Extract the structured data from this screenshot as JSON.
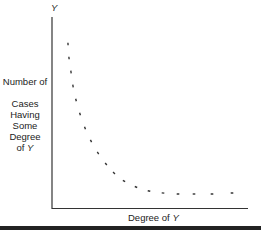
{
  "chart_data": {
    "type": "line",
    "title": "",
    "xlabel": "Degree of Y",
    "ylabel": "Number of Cases Having Some Degree of Y",
    "y_axis_top_label": "Y",
    "style": "dotted curve, decreasing, convex (reverse J-shaped distribution)",
    "grid": false,
    "ticks": false,
    "points_px": [
      [
        68,
        44
      ],
      [
        69,
        58
      ],
      [
        71,
        72
      ],
      [
        73,
        86
      ],
      [
        76,
        100
      ],
      [
        80,
        114
      ],
      [
        85,
        128
      ],
      [
        91,
        141
      ],
      [
        98,
        153
      ],
      [
        106,
        164
      ],
      [
        114,
        173
      ],
      [
        124,
        181
      ],
      [
        136,
        187
      ],
      [
        149,
        191
      ],
      [
        163,
        193
      ],
      [
        178,
        194
      ],
      [
        194,
        194
      ],
      [
        212,
        194
      ],
      [
        232,
        193
      ]
    ]
  },
  "labels": {
    "y_top": "Y",
    "y_line1": "Number of",
    "y_line2": "Cases Having",
    "y_line3": "Some Degree",
    "y_line4_prefix": "of ",
    "y_line4_var": "Y",
    "x_prefix": "Degree of ",
    "x_var": "Y"
  }
}
